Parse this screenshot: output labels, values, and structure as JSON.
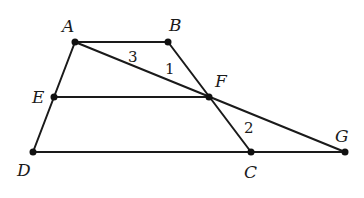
{
  "diagram": {
    "type": "geometry",
    "points": {
      "A": {
        "label": "A",
        "x": 75,
        "y": 42
      },
      "B": {
        "label": "B",
        "x": 168,
        "y": 42
      },
      "E": {
        "label": "E",
        "x": 54,
        "y": 97
      },
      "F": {
        "label": "F",
        "x": 209,
        "y": 97
      },
      "D": {
        "label": "D",
        "x": 33,
        "y": 152
      },
      "C": {
        "label": "C",
        "x": 251,
        "y": 152
      },
      "G": {
        "label": "G",
        "x": 345,
        "y": 152
      }
    },
    "segments": [
      "AB",
      "AD",
      "BC",
      "DG",
      "EF",
      "AG"
    ],
    "angle_labels": {
      "angle1": "1",
      "angle2": "2",
      "angle3": "3"
    }
  }
}
